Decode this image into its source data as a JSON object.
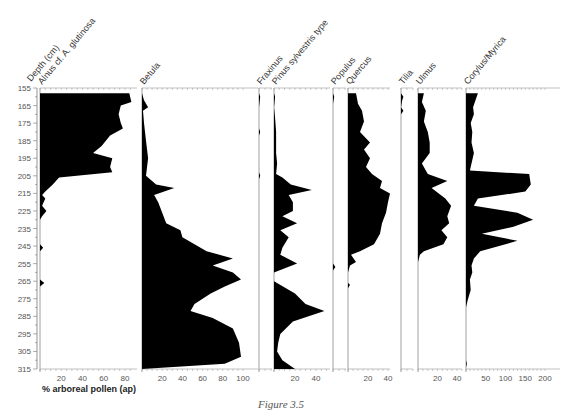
{
  "caption": "Figure 3.5",
  "chart_data": {
    "type": "area",
    "title": "",
    "xlabel": "% arboreal pollen (ap)",
    "ylabel": "Depth (cm)",
    "depth_range": [
      155,
      315
    ],
    "depth_ticks": [
      155,
      165,
      175,
      185,
      195,
      205,
      215,
      225,
      235,
      245,
      255,
      265,
      275,
      285,
      295,
      305,
      315
    ],
    "series": [
      {
        "name": "Alnus cf. A. glutinosa",
        "xlim": [
          0,
          88
        ],
        "ticks": [
          20,
          40,
          60,
          80
        ],
        "points": [
          [
            158,
            0
          ],
          [
            158,
            84
          ],
          [
            163,
            86
          ],
          [
            165,
            76
          ],
          [
            170,
            74
          ],
          [
            175,
            76
          ],
          [
            178,
            78
          ],
          [
            182,
            66
          ],
          [
            188,
            58
          ],
          [
            192,
            50
          ],
          [
            195,
            68
          ],
          [
            200,
            66
          ],
          [
            203,
            68
          ],
          [
            206,
            18
          ],
          [
            210,
            12
          ],
          [
            214,
            5
          ],
          [
            216,
            2
          ],
          [
            218,
            5
          ],
          [
            222,
            2
          ],
          [
            225,
            6
          ],
          [
            228,
            2
          ],
          [
            230,
            0
          ],
          [
            244,
            0
          ],
          [
            246,
            3
          ],
          [
            248,
            0
          ],
          [
            264,
            0
          ],
          [
            266,
            4
          ],
          [
            268,
            0
          ],
          [
            315,
            0
          ]
        ]
      },
      {
        "name": "Betula",
        "xlim": [
          0,
          100
        ],
        "ticks": [
          20,
          40,
          60,
          80,
          100
        ],
        "points": [
          [
            158,
            0
          ],
          [
            162,
            2
          ],
          [
            166,
            6
          ],
          [
            168,
            1
          ],
          [
            175,
            2
          ],
          [
            185,
            4
          ],
          [
            195,
            6
          ],
          [
            205,
            4
          ],
          [
            210,
            14
          ],
          [
            212,
            32
          ],
          [
            216,
            12
          ],
          [
            220,
            16
          ],
          [
            226,
            20
          ],
          [
            232,
            24
          ],
          [
            236,
            38
          ],
          [
            240,
            40
          ],
          [
            244,
            52
          ],
          [
            248,
            64
          ],
          [
            252,
            90
          ],
          [
            256,
            70
          ],
          [
            260,
            90
          ],
          [
            264,
            98
          ],
          [
            268,
            82
          ],
          [
            272,
            68
          ],
          [
            278,
            52
          ],
          [
            282,
            48
          ],
          [
            286,
            70
          ],
          [
            292,
            90
          ],
          [
            300,
            96
          ],
          [
            308,
            98
          ],
          [
            312,
            82
          ],
          [
            315,
            0
          ]
        ]
      },
      {
        "name": "Fraxinus",
        "xlim": [
          0,
          10
        ],
        "ticks": [],
        "points": [
          [
            158,
            0
          ],
          [
            160,
            1
          ],
          [
            166,
            0
          ],
          [
            178,
            0
          ],
          [
            180,
            1
          ],
          [
            182,
            0
          ],
          [
            203,
            0
          ],
          [
            205,
            1
          ],
          [
            207,
            0
          ],
          [
            315,
            0
          ]
        ]
      },
      {
        "name": "Pinus sylvestris type",
        "xlim": [
          0,
          50
        ],
        "ticks": [
          20,
          40
        ],
        "points": [
          [
            158,
            0
          ],
          [
            160,
            1
          ],
          [
            166,
            0
          ],
          [
            172,
            1
          ],
          [
            180,
            2
          ],
          [
            192,
            2
          ],
          [
            198,
            3
          ],
          [
            204,
            2
          ],
          [
            206,
            8
          ],
          [
            210,
            16
          ],
          [
            213,
            36
          ],
          [
            216,
            14
          ],
          [
            220,
            18
          ],
          [
            225,
            18
          ],
          [
            228,
            8
          ],
          [
            232,
            22
          ],
          [
            236,
            6
          ],
          [
            240,
            14
          ],
          [
            246,
            8
          ],
          [
            250,
            6
          ],
          [
            255,
            22
          ],
          [
            260,
            0
          ],
          [
            265,
            0
          ],
          [
            272,
            20
          ],
          [
            278,
            30
          ],
          [
            282,
            48
          ],
          [
            288,
            18
          ],
          [
            295,
            6
          ],
          [
            300,
            4
          ],
          [
            305,
            3
          ],
          [
            310,
            8
          ],
          [
            315,
            20
          ]
        ]
      },
      {
        "name": "Populus",
        "xlim": [
          0,
          10
        ],
        "ticks": [],
        "points": [
          [
            158,
            0
          ],
          [
            160,
            1
          ],
          [
            164,
            0
          ],
          [
            255,
            0
          ],
          [
            257,
            2
          ],
          [
            259,
            0
          ],
          [
            315,
            0
          ]
        ]
      },
      {
        "name": "Quercus",
        "xlim": [
          0,
          45
        ],
        "ticks": [
          20,
          40
        ],
        "points": [
          [
            158,
            0
          ],
          [
            158,
            8
          ],
          [
            164,
            10
          ],
          [
            168,
            14
          ],
          [
            174,
            16
          ],
          [
            180,
            12
          ],
          [
            186,
            22
          ],
          [
            190,
            16
          ],
          [
            195,
            22
          ],
          [
            200,
            18
          ],
          [
            204,
            24
          ],
          [
            208,
            34
          ],
          [
            212,
            32
          ],
          [
            215,
            42
          ],
          [
            220,
            40
          ],
          [
            226,
            38
          ],
          [
            232,
            34
          ],
          [
            238,
            32
          ],
          [
            244,
            26
          ],
          [
            248,
            12
          ],
          [
            250,
            3
          ],
          [
            254,
            8
          ],
          [
            256,
            2
          ],
          [
            260,
            0
          ],
          [
            266,
            0
          ],
          [
            267,
            2
          ],
          [
            269,
            0
          ],
          [
            315,
            0
          ]
        ]
      },
      {
        "name": "Tilia",
        "xlim": [
          0,
          10
        ],
        "ticks": [],
        "points": [
          [
            158,
            0
          ],
          [
            160,
            2
          ],
          [
            162,
            1
          ],
          [
            166,
            0
          ],
          [
            168,
            2
          ],
          [
            170,
            0
          ],
          [
            315,
            0
          ]
        ]
      },
      {
        "name": "Ulmus",
        "xlim": [
          0,
          45
        ],
        "ticks": [
          20,
          40
        ],
        "points": [
          [
            158,
            0
          ],
          [
            158,
            6
          ],
          [
            163,
            4
          ],
          [
            168,
            8
          ],
          [
            174,
            6
          ],
          [
            180,
            10
          ],
          [
            186,
            12
          ],
          [
            192,
            12
          ],
          [
            198,
            4
          ],
          [
            204,
            10
          ],
          [
            208,
            30
          ],
          [
            212,
            14
          ],
          [
            218,
            28
          ],
          [
            222,
            34
          ],
          [
            228,
            30
          ],
          [
            232,
            32
          ],
          [
            236,
            24
          ],
          [
            240,
            30
          ],
          [
            244,
            26
          ],
          [
            248,
            6
          ],
          [
            250,
            2
          ],
          [
            254,
            0
          ],
          [
            315,
            0
          ]
        ]
      },
      {
        "name": "Corylus/Myrica",
        "xlim": [
          0,
          200
        ],
        "ticks": [
          50,
          100,
          150,
          200
        ],
        "points": [
          [
            158,
            0
          ],
          [
            158,
            30
          ],
          [
            162,
            24
          ],
          [
            166,
            18
          ],
          [
            170,
            20
          ],
          [
            175,
            12
          ],
          [
            180,
            16
          ],
          [
            186,
            14
          ],
          [
            192,
            20
          ],
          [
            198,
            14
          ],
          [
            202,
            10
          ],
          [
            204,
            160
          ],
          [
            210,
            164
          ],
          [
            214,
            150
          ],
          [
            218,
            30
          ],
          [
            222,
            20
          ],
          [
            226,
            130
          ],
          [
            230,
            170
          ],
          [
            234,
            120
          ],
          [
            238,
            40
          ],
          [
            242,
            130
          ],
          [
            248,
            36
          ],
          [
            252,
            20
          ],
          [
            256,
            14
          ],
          [
            260,
            16
          ],
          [
            264,
            10
          ],
          [
            270,
            12
          ],
          [
            276,
            4
          ],
          [
            280,
            0
          ],
          [
            310,
            0
          ],
          [
            312,
            2
          ],
          [
            314,
            0
          ],
          [
            315,
            0
          ]
        ]
      }
    ]
  }
}
